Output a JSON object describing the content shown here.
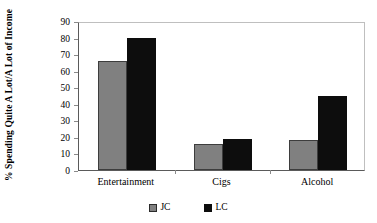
{
  "chart_data": {
    "type": "bar",
    "title": "",
    "xlabel": "",
    "ylabel": "% Spending Quite A Lot/A Lot of Income",
    "ylim": [
      0,
      90
    ],
    "ytick_step": 10,
    "yticks": [
      "90",
      "80",
      "70",
      "60",
      "50",
      "40",
      "30",
      "20",
      "10",
      "0"
    ],
    "grid": false,
    "legend_position": "bottom",
    "categories": [
      "Entertainment",
      "Cigs",
      "Alcohol"
    ],
    "series": [
      {
        "name": "JC",
        "color": "#808080",
        "values": [
          66,
          16,
          18
        ]
      },
      {
        "name": "LC",
        "color": "#0d0d0d",
        "values": [
          80,
          19,
          45
        ]
      }
    ]
  },
  "legend": {
    "items": [
      {
        "label": "JC",
        "swatch": "gray-swatch-icon"
      },
      {
        "label": "LC",
        "swatch": "black-swatch-icon"
      }
    ]
  }
}
